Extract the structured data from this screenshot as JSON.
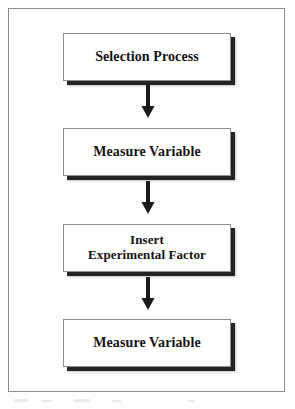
{
  "figure": {
    "type": "flowchart",
    "orientation": "vertical",
    "background_color": "#fdfdfc",
    "frame_color": "#8d8d8d",
    "node_fill": "#ffffff",
    "node_border": "#8e8e8e",
    "shadow_color": "#242424",
    "text_color": "#131313",
    "arrow_color": "#1a1a1a"
  },
  "nodes": [
    {
      "id": "selection-process",
      "label": "Selection Process"
    },
    {
      "id": "measure-variable-pre",
      "label": "Measure Variable"
    },
    {
      "id": "insert-experimental-factor",
      "label": "Insert\nExperimental Factor"
    },
    {
      "id": "measure-variable-post",
      "label": "Measure Variable"
    }
  ],
  "arrows": [
    {
      "id": "arrow-1",
      "from": "selection-process",
      "to": "measure-variable-pre",
      "direction": "down",
      "glyph": "down-arrow"
    },
    {
      "id": "arrow-2",
      "from": "measure-variable-pre",
      "to": "insert-experimental-factor",
      "direction": "down",
      "glyph": "down-arrow"
    },
    {
      "id": "arrow-3",
      "from": "insert-experimental-factor",
      "to": "measure-variable-post",
      "direction": "down",
      "glyph": "down-arrow"
    }
  ]
}
